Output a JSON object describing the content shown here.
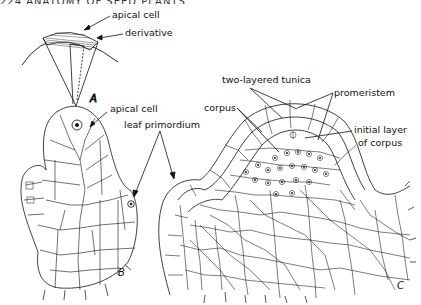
{
  "page_header": {
    "text": "224   ANATOMY OF SEED PLANTS",
    "cropped": true
  },
  "figure": {
    "panels": [
      {
        "id": "A",
        "label": "A",
        "annotations": [
          "apical cell",
          "derivative"
        ]
      },
      {
        "id": "B",
        "label": "B",
        "annotations": [
          "apical cell"
        ]
      },
      {
        "id": "C",
        "label": "C",
        "annotations": [
          "two-layered tunica",
          "corpus",
          "promeristem",
          "initial layer of corpus"
        ]
      }
    ],
    "shared_annotations": [
      "leaf primordium"
    ],
    "labels": {
      "apical_cell_a": "apical cell",
      "derivative": "derivative",
      "panel_a": "A",
      "apical_cell_b": "apical cell",
      "leaf_primordium": "leaf primordium",
      "panel_b": "B",
      "two_layered_tunica": "two-layered tunica",
      "corpus": "corpus",
      "promeristem": "promeristem",
      "initial_layer_1": "initial layer",
      "initial_layer_2": "of corpus",
      "panel_c": "C"
    },
    "colors": {
      "ink": "#111111",
      "background": "#ffffff"
    }
  }
}
